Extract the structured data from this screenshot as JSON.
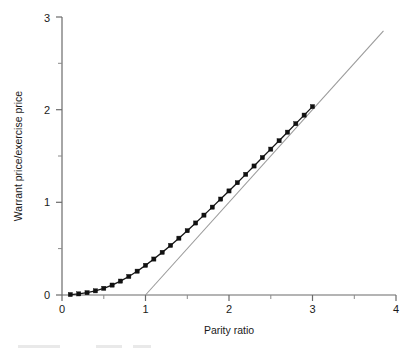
{
  "chart_data": {
    "type": "line",
    "title": "",
    "xlabel": "Parity ratio",
    "ylabel": "Warrant price/exercise price",
    "xlim": [
      0,
      4
    ],
    "ylim": [
      0,
      3
    ],
    "xticks": [
      0,
      1,
      2,
      3,
      4
    ],
    "xtick_labels": [
      "0",
      "1",
      "2",
      "3",
      "4"
    ],
    "x_minor_ticks": [
      0.5,
      1.5,
      2.5,
      3.5
    ],
    "yticks": [
      0,
      1,
      2,
      3
    ],
    "ytick_labels": [
      "0",
      "1",
      "2",
      "3"
    ],
    "y_minor_ticks": [
      0.5,
      1.5,
      2.5
    ],
    "grid": false,
    "legend": false,
    "legend_position": "none",
    "series": [
      {
        "name": "Warrant price curve",
        "marker": "square",
        "color": "#111111",
        "x": [
          0.1,
          0.2,
          0.3,
          0.4,
          0.5,
          0.6,
          0.7,
          0.8,
          0.9,
          1.0,
          1.1,
          1.2,
          1.3,
          1.4,
          1.5,
          1.6,
          1.7,
          1.8,
          1.9,
          2.0,
          2.1,
          2.2,
          2.3,
          2.4,
          2.5,
          2.6,
          2.7,
          2.8,
          2.9,
          3.0
        ],
        "values": [
          0.005,
          0.012,
          0.025,
          0.045,
          0.072,
          0.107,
          0.15,
          0.2,
          0.257,
          0.32,
          0.388,
          0.46,
          0.535,
          0.613,
          0.694,
          0.777,
          0.862,
          0.948,
          1.035,
          1.123,
          1.212,
          1.302,
          1.392,
          1.483,
          1.574,
          1.665,
          1.757,
          1.849,
          1.941,
          2.033
        ]
      },
      {
        "name": "Intrinsic value line",
        "marker": "none",
        "color": "#9a9a9a",
        "x": [
          1.0,
          3.85
        ],
        "values": [
          0.0,
          2.85
        ]
      }
    ]
  },
  "axes": {
    "x_axis_name": "parity-ratio-axis",
    "y_axis_name": "warrant-price-axis"
  }
}
